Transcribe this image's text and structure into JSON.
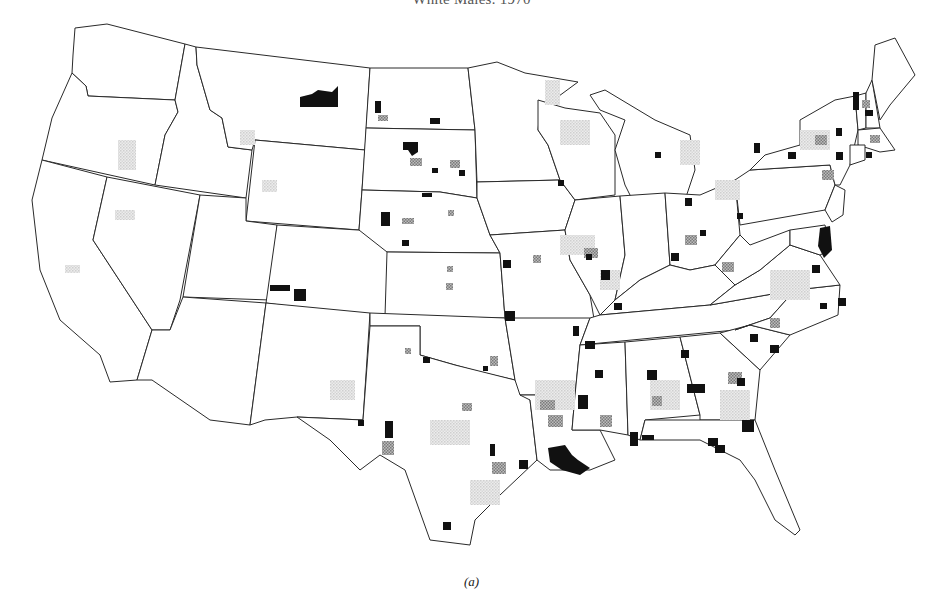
{
  "figure": {
    "title": "White Males: 1970",
    "caption": "(a)"
  },
  "map": {
    "region": "Contiguous United States",
    "unit": "county",
    "legend_classes": [
      {
        "name": "high",
        "style": "solid black",
        "color": "#111111"
      },
      {
        "name": "medium",
        "style": "dark stipple",
        "color": "#8a8a8a"
      },
      {
        "name": "low",
        "style": "light stipple",
        "color": "#cfcfcf"
      }
    ],
    "states": [
      "Washington",
      "Oregon",
      "California",
      "Idaho",
      "Nevada",
      "Montana",
      "Wyoming",
      "Utah",
      "Arizona",
      "Colorado",
      "New Mexico",
      "North Dakota",
      "South Dakota",
      "Nebraska",
      "Kansas",
      "Oklahoma",
      "Texas",
      "Minnesota",
      "Iowa",
      "Missouri",
      "Arkansas",
      "Louisiana",
      "Wisconsin",
      "Illinois",
      "Michigan",
      "Indiana",
      "Ohio",
      "Kentucky",
      "Tennessee",
      "Mississippi",
      "Alabama",
      "Georgia",
      "Florida",
      "South Carolina",
      "North Carolina",
      "Virginia",
      "West Virginia",
      "Pennsylvania",
      "New York",
      "Maryland",
      "Delaware",
      "New Jersey",
      "Connecticut",
      "Rhode Island",
      "Massachusetts",
      "Vermont",
      "New Hampshire",
      "Maine"
    ],
    "high_clusters": [
      {
        "x": 318,
        "y": 97,
        "w": 38,
        "h": 12,
        "label": "NE Montana"
      },
      {
        "x": 375,
        "y": 101,
        "w": 6,
        "h": 12,
        "label": "ND west"
      },
      {
        "x": 430,
        "y": 118,
        "w": 10,
        "h": 6,
        "label": "ND south"
      },
      {
        "x": 404,
        "y": 143,
        "w": 14,
        "h": 12,
        "label": "SD central"
      },
      {
        "x": 432,
        "y": 168,
        "w": 6,
        "h": 5,
        "label": "SD east"
      },
      {
        "x": 460,
        "y": 171,
        "w": 5,
        "h": 6,
        "label": "SD east 2"
      },
      {
        "x": 382,
        "y": 212,
        "w": 8,
        "h": 14,
        "label": "NE west"
      },
      {
        "x": 402,
        "y": 240,
        "w": 7,
        "h": 6,
        "label": "NE southwest"
      },
      {
        "x": 270,
        "y": 285,
        "w": 20,
        "h": 6,
        "label": "CO west"
      },
      {
        "x": 294,
        "y": 288,
        "w": 12,
        "h": 12,
        "label": "CO west 2"
      },
      {
        "x": 503,
        "y": 260,
        "w": 8,
        "h": 8,
        "label": "MO KC"
      },
      {
        "x": 505,
        "y": 311,
        "w": 10,
        "h": 10,
        "label": "MO SW"
      },
      {
        "x": 423,
        "y": 358,
        "w": 7,
        "h": 5,
        "label": "OK"
      },
      {
        "x": 483,
        "y": 366,
        "w": 5,
        "h": 5,
        "label": "OK 2"
      },
      {
        "x": 386,
        "y": 421,
        "w": 8,
        "h": 16,
        "label": "TX west"
      },
      {
        "x": 358,
        "y": 420,
        "w": 6,
        "h": 6,
        "label": "TX NM border"
      },
      {
        "x": 443,
        "y": 522,
        "w": 8,
        "h": 8,
        "label": "TX south"
      },
      {
        "x": 490,
        "y": 445,
        "w": 5,
        "h": 10,
        "label": "TX east"
      },
      {
        "x": 521,
        "y": 462,
        "w": 8,
        "h": 8,
        "label": "TX Houston"
      },
      {
        "x": 545,
        "y": 447,
        "w": 28,
        "h": 28,
        "label": "LA south"
      },
      {
        "x": 578,
        "y": 395,
        "w": 10,
        "h": 14,
        "label": "MS"
      },
      {
        "x": 631,
        "y": 432,
        "w": 8,
        "h": 14,
        "label": "AL south"
      },
      {
        "x": 651,
        "y": 364,
        "w": 10,
        "h": 8,
        "label": "AL"
      },
      {
        "x": 682,
        "y": 352,
        "w": 8,
        "h": 8,
        "label": "GA west"
      },
      {
        "x": 688,
        "y": 385,
        "w": 16,
        "h": 8,
        "label": "GA south"
      },
      {
        "x": 744,
        "y": 420,
        "w": 10,
        "h": 10,
        "label": "GA coast"
      },
      {
        "x": 752,
        "y": 334,
        "w": 8,
        "h": 8,
        "label": "SC"
      },
      {
        "x": 771,
        "y": 345,
        "w": 8,
        "h": 8,
        "label": "SC 2"
      },
      {
        "x": 585,
        "y": 341,
        "w": 10,
        "h": 8,
        "label": "TN west"
      },
      {
        "x": 558,
        "y": 181,
        "w": 6,
        "h": 6,
        "label": "IL"
      },
      {
        "x": 586,
        "y": 254,
        "w": 6,
        "h": 6,
        "label": "IN"
      },
      {
        "x": 671,
        "y": 253,
        "w": 8,
        "h": 8,
        "label": "OH south"
      },
      {
        "x": 685,
        "y": 201,
        "w": 6,
        "h": 6,
        "label": "MI south"
      },
      {
        "x": 657,
        "y": 152,
        "w": 6,
        "h": 6,
        "label": "MI north"
      },
      {
        "x": 755,
        "y": 145,
        "w": 6,
        "h": 8,
        "label": "NY west"
      },
      {
        "x": 788,
        "y": 152,
        "w": 8,
        "h": 7,
        "label": "NY central"
      },
      {
        "x": 853,
        "y": 92,
        "w": 6,
        "h": 18,
        "label": "NH/ME"
      },
      {
        "x": 820,
        "y": 230,
        "w": 10,
        "h": 28,
        "label": "MD/VA"
      },
      {
        "x": 840,
        "y": 300,
        "w": 8,
        "h": 8,
        "label": "NC east"
      }
    ]
  }
}
